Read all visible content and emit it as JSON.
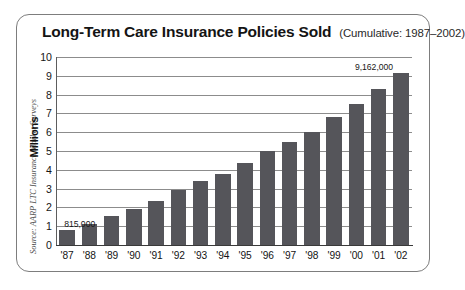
{
  "figure": {
    "title_main": "Long-Term Care Insurance Policies Sold",
    "title_sub": "(Cumulative: 1987–2002)",
    "source_note": "Source: AARP LTC Insurance Market Surveys",
    "frame_color": "#7d7d7d",
    "bar_color": "#55555a",
    "gridline_color": "#8c8c8c"
  },
  "chart_data": {
    "type": "bar",
    "title": "Long-Term Care Insurance Policies Sold",
    "subtitle": "(Cumulative: 1987–2002)",
    "xlabel": "",
    "ylabel": "Millions",
    "ylim": [
      0,
      10
    ],
    "yticks": [
      0,
      1,
      2,
      3,
      4,
      5,
      6,
      7,
      8,
      9,
      10
    ],
    "ytick_labels": [
      "0",
      "1",
      "2",
      "3",
      "4",
      "5",
      "6",
      "7",
      "8",
      "9",
      "10"
    ],
    "grid": true,
    "legend": null,
    "categories": [
      "'87",
      "'88",
      "'89",
      "'90",
      "'91",
      "'92",
      "'93",
      "'94",
      "'95",
      "'96",
      "'97",
      "'98",
      "'99",
      "'00",
      "'01",
      "'02"
    ],
    "values": [
      0.815,
      1.1,
      1.55,
      1.9,
      2.35,
      2.9,
      3.4,
      3.8,
      4.35,
      5.0,
      5.5,
      6.0,
      6.8,
      7.5,
      8.3,
      9.162
    ],
    "annotations": [
      {
        "category": "'87",
        "text": "815,000",
        "value": 0.815
      },
      {
        "category": "'02",
        "text": "9,162,000",
        "value": 9.162
      }
    ]
  }
}
